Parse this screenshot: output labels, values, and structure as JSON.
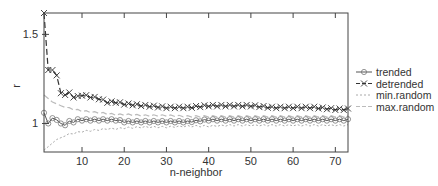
{
  "chart_data": {
    "type": "line",
    "title": "",
    "xlabel": "n-neighbor",
    "ylabel": "r",
    "xlim": [
      1,
      73
    ],
    "ylim": [
      0.84,
      1.62
    ],
    "xticks": [
      10,
      20,
      30,
      40,
      50,
      60,
      70
    ],
    "yticks": [
      1,
      1.5
    ],
    "grid": false,
    "legend_position": "right",
    "x": [
      1,
      2,
      3,
      4,
      5,
      6,
      7,
      8,
      9,
      10,
      12,
      14,
      16,
      18,
      20,
      25,
      30,
      35,
      40,
      45,
      50,
      55,
      60,
      65,
      70,
      73
    ],
    "series": [
      {
        "name": "trended",
        "style": "solid-circle",
        "color": "#555555",
        "values": [
          1.06,
          1.0,
          1.03,
          1.02,
          1.0,
          0.99,
          1.01,
          1.01,
          1.02,
          1.02,
          1.02,
          1.02,
          1.02,
          1.02,
          1.01,
          1.01,
          1.01,
          1.01,
          1.02,
          1.02,
          1.02,
          1.02,
          1.02,
          1.02,
          1.02,
          1.02
        ]
      },
      {
        "name": "detrended",
        "style": "dashed-x",
        "color": "#333333",
        "values": [
          1.62,
          1.3,
          1.3,
          1.27,
          1.17,
          1.16,
          1.17,
          1.15,
          1.15,
          1.16,
          1.15,
          1.14,
          1.12,
          1.12,
          1.11,
          1.1,
          1.09,
          1.09,
          1.1,
          1.1,
          1.1,
          1.09,
          1.09,
          1.09,
          1.08,
          1.08
        ]
      },
      {
        "name": "min.random",
        "style": "dotted",
        "color": "#aaaaaa",
        "values": [
          0.85,
          0.87,
          0.89,
          0.91,
          0.92,
          0.93,
          0.94,
          0.945,
          0.95,
          0.955,
          0.96,
          0.965,
          0.97,
          0.97,
          0.975,
          0.98,
          0.98,
          0.985,
          0.985,
          0.99,
          0.99,
          0.99,
          0.99,
          0.99,
          0.99,
          0.99
        ]
      },
      {
        "name": "max.random",
        "style": "dashed",
        "color": "#bbbbbb",
        "values": [
          1.16,
          1.14,
          1.12,
          1.11,
          1.1,
          1.09,
          1.085,
          1.08,
          1.075,
          1.07,
          1.065,
          1.06,
          1.055,
          1.05,
          1.05,
          1.045,
          1.045,
          1.04,
          1.04,
          1.04,
          1.04,
          1.04,
          1.04,
          1.04,
          1.04,
          1.04
        ]
      }
    ]
  },
  "axes": {
    "xlabel": "n-neighbor",
    "ylabel": "r",
    "xtick_labels": [
      "10",
      "20",
      "30",
      "40",
      "50",
      "60",
      "70"
    ],
    "ytick_labels": [
      "1",
      "1.5"
    ]
  },
  "legend": {
    "items": [
      {
        "label": "trended"
      },
      {
        "label": "detrended"
      },
      {
        "label": "min.random"
      },
      {
        "label": "max.random"
      }
    ]
  }
}
